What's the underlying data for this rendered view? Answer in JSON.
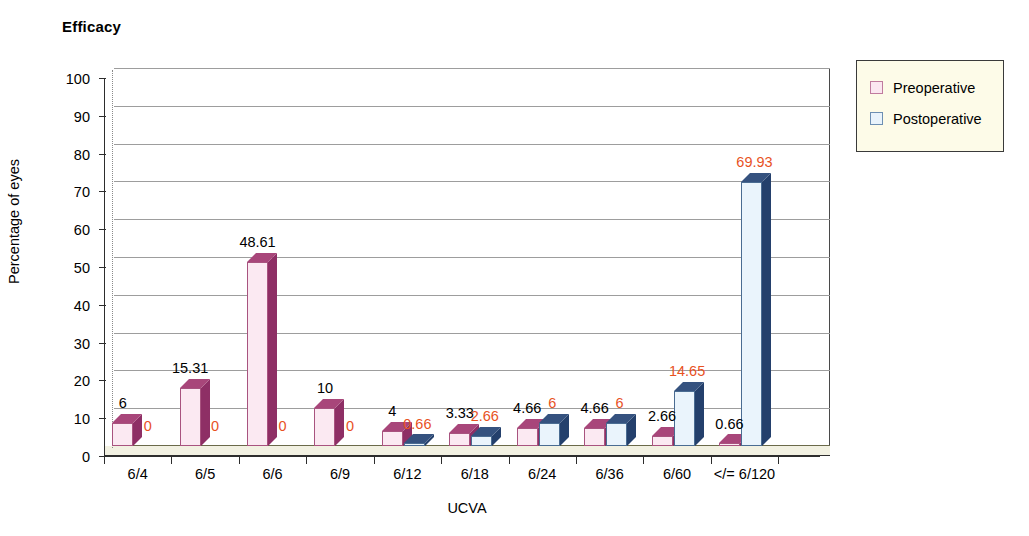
{
  "chart_data": {
    "type": "bar",
    "title": "Efficacy",
    "xlabel": "UCVA",
    "ylabel": "Percentage of eyes",
    "ylim": [
      0,
      100
    ],
    "ytick_step": 10,
    "ytick_labels": [
      "0",
      "10",
      "20",
      "30",
      "40",
      "50",
      "60",
      "70",
      "80",
      "90",
      "100"
    ],
    "grid": true,
    "legend_position": "right-outside",
    "categories": [
      "6/4",
      "6/5",
      "6/6",
      "6/9",
      "6/12",
      "6/18",
      "6/24",
      "6/36",
      "6/60",
      "</= 6/120"
    ],
    "series": [
      {
        "name": "Preoperative",
        "color": "#fbe9f2",
        "label_color": "#000000",
        "values": [
          6,
          15.31,
          48.61,
          10,
          4,
          3.33,
          4.66,
          4.66,
          2.66,
          0.66
        ],
        "labels": [
          "6",
          "15.31",
          "48.61",
          "10",
          "4",
          "3.33",
          "4.66",
          "4.66",
          "2.66",
          "0.66"
        ]
      },
      {
        "name": "Postoperative",
        "color": "#eaf4fc",
        "label_color": "#e8521f",
        "values": [
          0,
          0,
          0,
          0,
          0.66,
          2.66,
          6,
          6,
          14.65,
          69.93
        ],
        "labels": [
          "0",
          "0",
          "0",
          "0",
          "0.66",
          "2.66",
          "6",
          "6",
          "14.65",
          "69.93"
        ]
      }
    ]
  },
  "legend": {
    "items": [
      {
        "label": "Preoperative"
      },
      {
        "label": "Postoperative"
      }
    ]
  }
}
